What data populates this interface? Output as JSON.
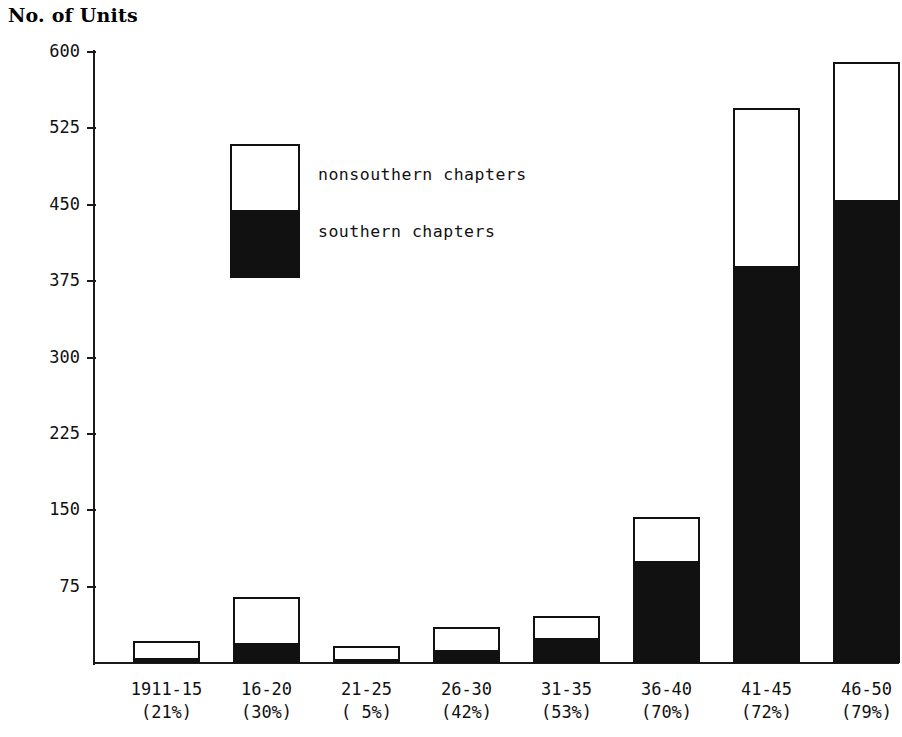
{
  "chart_data": {
    "type": "bar",
    "subtype": "stacked",
    "title": "No. of Units",
    "xlabel": "",
    "ylabel": "No. of Units",
    "ylim": [
      0,
      600
    ],
    "yticks": [
      600,
      525,
      450,
      375,
      300,
      225,
      150,
      75
    ],
    "grid": false,
    "legend_position": "inside-upper-left",
    "categories": [
      "1911-15",
      "16-20",
      "21-25",
      "26-30",
      "31-35",
      "36-40",
      "41-45",
      "46-50"
    ],
    "category_sublabels": [
      "(21%)",
      "(30%)",
      "( 5%)",
      "(42%)",
      "(53%)",
      "(70%)",
      "(72%)",
      "(79%)"
    ],
    "series": [
      {
        "name": "southern chapters",
        "color": "#111111",
        "values": [
          5,
          20,
          4,
          13,
          25,
          100,
          390,
          455
        ]
      },
      {
        "name": "nonsouthern chapters",
        "color": "#ffffff",
        "values": [
          17,
          45,
          13,
          22,
          21,
          43,
          155,
          135
        ]
      }
    ],
    "totals": [
      22,
      65,
      17,
      35,
      46,
      143,
      545,
      590
    ]
  },
  "axis": {
    "title": "No. of Units"
  },
  "legend": {
    "items": [
      {
        "label": "nonsouthern chapters",
        "swatch": "white"
      },
      {
        "label": "southern chapters",
        "swatch": "black"
      }
    ]
  },
  "colors": {
    "ink": "#111111",
    "paper": "#ffffff"
  }
}
